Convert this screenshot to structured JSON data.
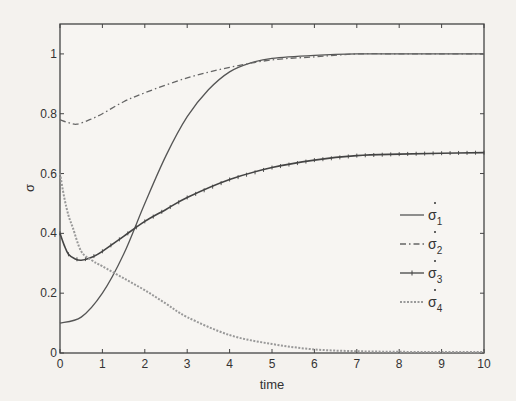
{
  "chart_data": {
    "type": "line",
    "title": "",
    "xlabel": "time",
    "ylabel": "σ",
    "xlim": [
      0,
      10
    ],
    "ylim": [
      0,
      1.1
    ],
    "xticks": [
      0,
      1,
      2,
      3,
      4,
      5,
      6,
      7,
      8,
      9,
      10
    ],
    "yticks": [
      0,
      0.2,
      0.4,
      0.6,
      0.8,
      1
    ],
    "ytick_labels": [
      "0",
      "0.2",
      "0.4",
      "0.6",
      "0.8",
      "1"
    ],
    "grid": false,
    "legend_position": "center-right",
    "series": [
      {
        "name": "σ1*",
        "base": "σ",
        "sub": "1",
        "style": "solid",
        "color": "#555555",
        "x": [
          0,
          0.5,
          1,
          1.5,
          2,
          2.5,
          3,
          3.5,
          4,
          4.5,
          5,
          6,
          7,
          8,
          9,
          10
        ],
        "y": [
          0.1,
          0.12,
          0.2,
          0.33,
          0.5,
          0.66,
          0.79,
          0.88,
          0.94,
          0.97,
          0.985,
          0.995,
          1.0,
          1.0,
          1.0,
          1.0
        ]
      },
      {
        "name": "σ2*",
        "base": "σ",
        "sub": "2",
        "style": "dashdot",
        "color": "#666666",
        "x": [
          0,
          0.2,
          0.4,
          0.7,
          1,
          1.5,
          2,
          3,
          4,
          5,
          6,
          7,
          8,
          9,
          10
        ],
        "y": [
          0.78,
          0.77,
          0.765,
          0.78,
          0.8,
          0.84,
          0.87,
          0.92,
          0.955,
          0.98,
          0.99,
          1.0,
          1.0,
          1.0,
          1.0
        ]
      },
      {
        "name": "σ3*",
        "base": "σ",
        "sub": "3",
        "style": "solid-plus",
        "color": "#444444",
        "x": [
          0,
          0.1,
          0.2,
          0.35,
          0.5,
          0.75,
          1,
          1.5,
          2,
          2.5,
          3,
          4,
          5,
          6,
          7,
          8,
          9,
          10
        ],
        "y": [
          0.4,
          0.36,
          0.33,
          0.315,
          0.31,
          0.32,
          0.34,
          0.39,
          0.44,
          0.48,
          0.52,
          0.58,
          0.62,
          0.645,
          0.66,
          0.665,
          0.668,
          0.67
        ]
      },
      {
        "name": "σ4*",
        "base": "σ",
        "sub": "4",
        "style": "dotted",
        "color": "#999999",
        "x": [
          0,
          0.1,
          0.2,
          0.3,
          0.5,
          0.75,
          1,
          1.5,
          2,
          2.5,
          3,
          4,
          5,
          6,
          7,
          8,
          9,
          10
        ],
        "y": [
          0.6,
          0.52,
          0.46,
          0.42,
          0.34,
          0.31,
          0.29,
          0.25,
          0.21,
          0.165,
          0.12,
          0.06,
          0.03,
          0.012,
          0.006,
          0.004,
          0.003,
          0.003
        ]
      }
    ]
  },
  "labels": {
    "xlabel": "time",
    "ylabel": "σ"
  }
}
